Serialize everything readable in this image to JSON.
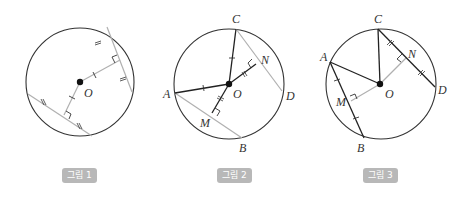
{
  "colors": {
    "circle": "#333333",
    "dark_line": "#222222",
    "light_line": "#b0b0b0",
    "badge_bg": "#b8b8b8",
    "badge_text": "#ffffff"
  },
  "figures": [
    {
      "caption": "그림 1",
      "center_label": "O",
      "points": []
    },
    {
      "caption": "그림 2",
      "center_label": "O",
      "points": [
        "A",
        "B",
        "C",
        "D",
        "M",
        "N"
      ]
    },
    {
      "caption": "그림 3",
      "center_label": "O",
      "points": [
        "A",
        "B",
        "C",
        "D",
        "M",
        "N"
      ]
    }
  ],
  "labels": {
    "f1": {
      "O": "O"
    },
    "f2": {
      "A": "A",
      "B": "B",
      "C": "C",
      "D": "D",
      "M": "M",
      "N": "N",
      "O": "O"
    },
    "f3": {
      "A": "A",
      "B": "B",
      "C": "C",
      "D": "D",
      "M": "M",
      "N": "N",
      "O": "O"
    }
  }
}
